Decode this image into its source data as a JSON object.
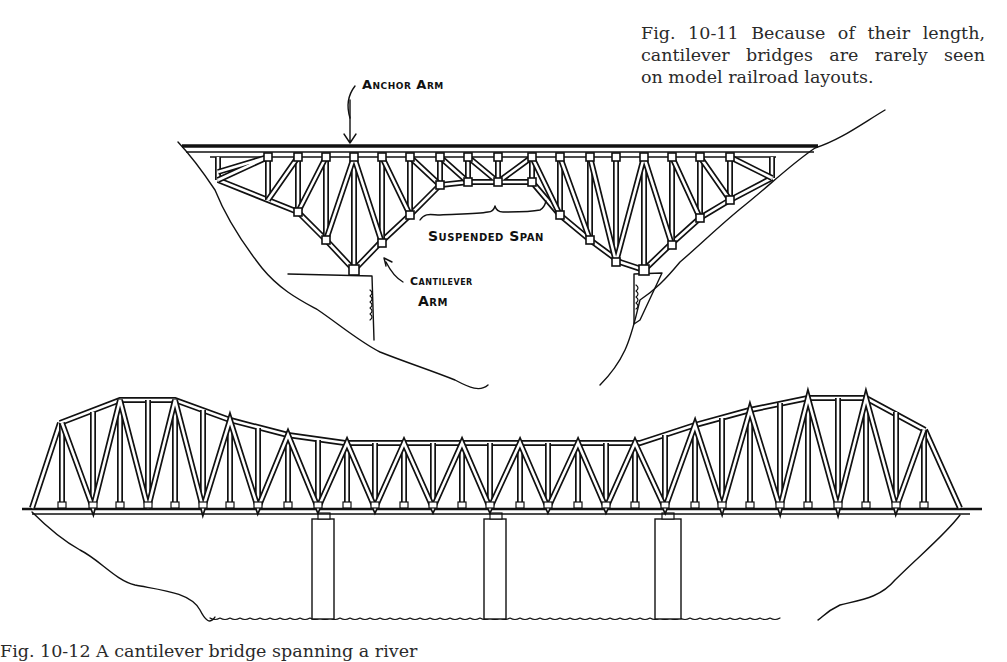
{
  "figure_top": {
    "caption_lines": [
      "Fig. 10-11 Because of their length,",
      "cantilever bridges are rarely seen",
      "on model railroad layouts."
    ],
    "labels": {
      "anchor_arm": "Anchor Arm",
      "suspended_span": "Suspended Span",
      "cantilever_arm_1": "Cantilever",
      "cantilever_arm_2": "Arm"
    }
  },
  "figure_bottom": {
    "caption": "Fig. 10-12 A cantilever bridge spanning a river"
  },
  "colors": {
    "ink": "#111111",
    "paper": "#ffffff",
    "text": "#2a2a2a"
  }
}
